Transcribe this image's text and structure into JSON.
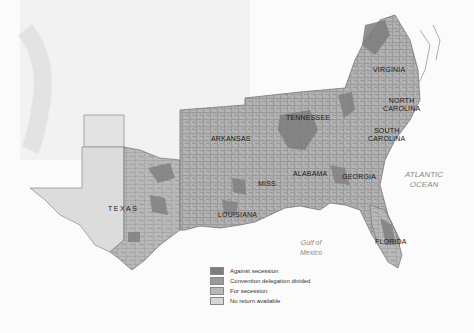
{
  "map": {
    "states": [
      {
        "name": "VIRGINIA",
        "x": 388,
        "y": 68
      },
      {
        "name": "NORTH\nCAROLINA",
        "x": 392,
        "y": 98
      },
      {
        "name": "SOUTH\nCAROLINA",
        "x": 372,
        "y": 130
      },
      {
        "name": "TENNESSEE",
        "x": 286,
        "y": 114
      },
      {
        "name": "ARKANSAS",
        "x": 212,
        "y": 134
      },
      {
        "name": "MISS.",
        "x": 258,
        "y": 180
      },
      {
        "name": "ALABAMA",
        "x": 295,
        "y": 170
      },
      {
        "name": "GEORGIA",
        "x": 345,
        "y": 173
      },
      {
        "name": "LOUISIANA",
        "x": 221,
        "y": 213
      },
      {
        "name": "TEXAS",
        "x": 108,
        "y": 205
      },
      {
        "name": "FLORIDA",
        "x": 380,
        "y": 240
      }
    ],
    "water_labels": [
      {
        "name": "ATLANTIC\nOCEAN",
        "x": 405,
        "y": 170
      },
      {
        "name": "Gulf of\nMexico",
        "x": 306,
        "y": 238
      }
    ],
    "legend": {
      "items": [
        {
          "label": "Against secession",
          "color": "#7d7d7d"
        },
        {
          "label": "Convention delegation divided",
          "color": "#9a9a9a"
        },
        {
          "label": "For secession",
          "color": "#b8b8b8"
        },
        {
          "label": "No return available",
          "color": "#d6d6d6"
        }
      ]
    },
    "colors": {
      "land": "#b5b5b5",
      "against": "#7d7d7d",
      "divided": "#9a9a9a",
      "no_return": "#dcdcdc",
      "border": "#6e6e6e",
      "background": "#fbfbfb"
    }
  }
}
